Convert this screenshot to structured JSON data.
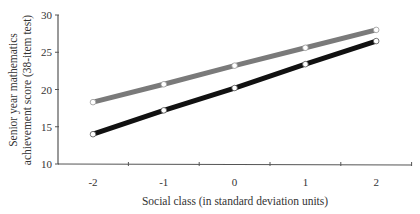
{
  "chart_data": {
    "type": "line",
    "title": "",
    "xlabel": "Social class (in standard deviation units)",
    "ylabel_line1": "Senior year mathematics",
    "ylabel_line2": "achievement score (38-item test)",
    "ylabel": "Senior year mathematics achievement score (38-item test)",
    "x": [
      -2,
      -1,
      0,
      1,
      2
    ],
    "x_tick_labels": [
      "-2",
      "-1",
      "0",
      "1",
      "2"
    ],
    "y_ticks": [
      10,
      15,
      20,
      25,
      30
    ],
    "y_tick_labels": [
      "10",
      "15",
      "20",
      "25",
      "30"
    ],
    "ylim": [
      10,
      30
    ],
    "xlim": [
      -2.5,
      2.5
    ],
    "grid": false,
    "legend": null,
    "series": [
      {
        "name": "gray-line",
        "color": "#7a7a7a",
        "values": [
          18.3,
          20.7,
          23.2,
          25.6,
          28.0
        ]
      },
      {
        "name": "black-line",
        "color": "#111111",
        "values": [
          14.0,
          17.2,
          20.2,
          23.4,
          26.5
        ]
      }
    ]
  }
}
